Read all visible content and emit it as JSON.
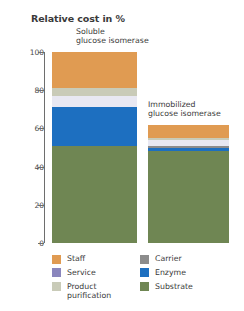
{
  "chart_data": {
    "type": "bar",
    "subtype": "stacked-bar",
    "title": "Relative cost in %",
    "xlabel": "",
    "ylabel": "",
    "ylim": [
      0,
      100
    ],
    "yticks": [
      0,
      20,
      40,
      60,
      80,
      100
    ],
    "ytick_labels": [
      "0",
      "20",
      "40",
      "60",
      "80",
      "100"
    ],
    "grid": false,
    "legend_position": "bottom",
    "categories": [
      "Soluble glucose isomerase",
      "Immobilized glucose isomerase"
    ],
    "category_labels": [
      "Soluble\nglucose isomerase",
      "Immobilized\nglucose isomerase"
    ],
    "series": [
      {
        "name": "Staff",
        "color": "#e09b52",
        "values": [
          19,
          7
        ]
      },
      {
        "name": "Product purification",
        "color": "#c9cbb8",
        "values": [
          4,
          1
        ]
      },
      {
        "name": "Service",
        "color": "#e8e8f2",
        "values": [
          6,
          3
        ]
      },
      {
        "name": "Carrier",
        "color": "#8c8c8c",
        "values": [
          0,
          1.5
        ]
      },
      {
        "name": "Enzyme",
        "color": "#1d6fc0",
        "values": [
          20,
          1.5
        ]
      },
      {
        "name": "Substrate",
        "color": "#6f8653",
        "values": [
          51,
          48
        ]
      }
    ],
    "totals": [
      100,
      62
    ],
    "annotations": []
  },
  "legend": {
    "left_column": [
      {
        "label": "Staff",
        "color": "#e09b52",
        "icon": "color-swatch"
      },
      {
        "label": "Service",
        "color": "#8a86bd",
        "icon": "color-swatch"
      },
      {
        "label": "Product\npurification",
        "color": "#c9cbb8",
        "icon": "color-swatch"
      }
    ],
    "right_column": [
      {
        "label": "Carrier",
        "color": "#8c8c8c",
        "icon": "color-swatch"
      },
      {
        "label": "Enzyme",
        "color": "#1d6fc0",
        "icon": "color-swatch"
      },
      {
        "label": "Substrate",
        "color": "#6f8653",
        "icon": "color-swatch"
      }
    ]
  }
}
